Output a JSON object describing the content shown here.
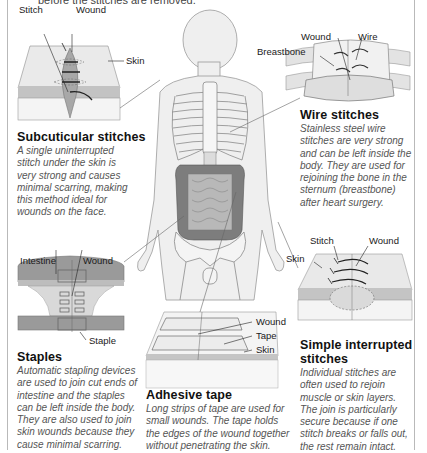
{
  "header": {
    "partial_text": "before the stitches are removed."
  },
  "subcuticular": {
    "labels": {
      "stitch": "Stitch",
      "wound": "Wound",
      "skin": "Skin"
    },
    "title": "Subcuticular stitches",
    "desc": [
      "A single uninterrupted",
      "stitch under the skin is",
      "very strong and causes",
      "minimal scarring, making",
      "this method ideal for",
      "wounds on the face."
    ]
  },
  "wire": {
    "labels": {
      "wound": "Wound",
      "wire": "Wire",
      "breastbone": "Breastbone"
    },
    "title": "Wire stitches",
    "desc": [
      "Stainless steel wire",
      "stitches are very strong",
      "and can be left inside the",
      "body. They are used for",
      "rejoining the bone in the",
      "sternum (breastbone)",
      "after heart surgery."
    ]
  },
  "staples": {
    "labels": {
      "intestine": "Intestine",
      "wound": "Wound",
      "staple": "Staple"
    },
    "title": "Staples",
    "desc": [
      "Automatic stapling devices",
      "are used to join cut ends of",
      "intestine and the staples",
      "can be left inside the body.",
      "They are also used to join",
      "skin wounds because they",
      "cause minimal scarring."
    ]
  },
  "tape": {
    "labels": {
      "wound": "Wound",
      "tape": "Tape",
      "skin": "Skin"
    },
    "title": "Adhesive tape",
    "desc": [
      "Long strips of tape are used for",
      "small wounds. The tape holds",
      "the edges of the wound together",
      "without penetrating the skin."
    ]
  },
  "interrupted": {
    "labels": {
      "stitch": "Stitch",
      "wound": "Wound",
      "skin": "Skin"
    },
    "title_lines": [
      "Simple interrupted",
      "stitches"
    ],
    "desc": [
      "Individual stitches are",
      "often used to rejoin",
      "muscle or skin layers.",
      "The join is particularly",
      "secure because if one",
      "stitch breaks or falls out,",
      "the rest remain intact."
    ]
  },
  "colors": {
    "skin_top": "#e9e9e9",
    "skin_layer": "#c4c4c4",
    "body_fill": "#ececec",
    "intestine_dark": "#8a8a8a",
    "text_desc": "#555555"
  }
}
